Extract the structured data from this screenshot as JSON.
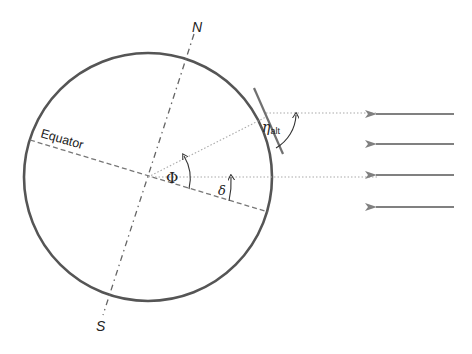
{
  "diagram": {
    "labels": {
      "north": "N",
      "south": "S",
      "equator": "Equator",
      "latitude": "Φ",
      "declination": "δ",
      "altitude_symbol": "η",
      "altitude_subscript": "alt"
    },
    "sun_rays": {
      "count": 4,
      "direction": "right-to-left"
    },
    "colors": {
      "earth_outline": "#555555",
      "axis_dashed": "#666666",
      "guide_dotted": "#9a9a9a",
      "ray_arrow": "#808080",
      "tangent_line": "#707070",
      "text": "#222222"
    }
  }
}
